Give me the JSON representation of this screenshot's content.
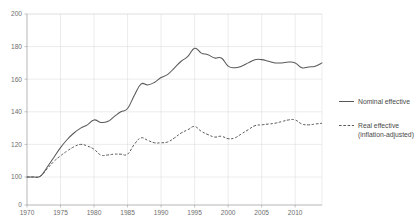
{
  "chart_data": {
    "type": "line",
    "title": "",
    "xlabel": "",
    "ylabel": "",
    "grid": true,
    "legend_position": "right",
    "xlim": [
      1970,
      2014
    ],
    "ylim": [
      0,
      200
    ],
    "y_axis_break": true,
    "y_tick_labels": [
      "200",
      "180",
      "160",
      "140",
      "120",
      "100",
      "0"
    ],
    "y_ticks": [
      200,
      180,
      160,
      140,
      120,
      100,
      0
    ],
    "x_tick_labels": [
      "1970",
      "1975",
      "1980",
      "1985",
      "1990",
      "1995",
      "2000",
      "2005",
      "2010"
    ],
    "x_ticks": [
      1970,
      1975,
      1980,
      1985,
      1990,
      1995,
      2000,
      2005,
      2010
    ],
    "x": [
      1970,
      1971,
      1972,
      1973,
      1974,
      1975,
      1976,
      1977,
      1978,
      1979,
      1980,
      1981,
      1982,
      1983,
      1984,
      1985,
      1986,
      1987,
      1988,
      1989,
      1990,
      1991,
      1992,
      1993,
      1994,
      1995,
      1996,
      1997,
      1998,
      1999,
      2000,
      2001,
      2002,
      2003,
      2004,
      2005,
      2006,
      2007,
      2008,
      2009,
      2010,
      2011,
      2012,
      2013,
      2014
    ],
    "series": [
      {
        "name": "Nominal effective",
        "style": "solid",
        "color": "#595959",
        "values": [
          100,
          100,
          100.5,
          106,
          112,
          118,
          123,
          127,
          130,
          132,
          135,
          133.5,
          134,
          137,
          140,
          142,
          150,
          157,
          156.5,
          158,
          161,
          163,
          167,
          171,
          174,
          179,
          176,
          175,
          173,
          173,
          168,
          167,
          168,
          170,
          172,
          172,
          171,
          170,
          170,
          170.5,
          170,
          167,
          167.5,
          168,
          170
        ]
      },
      {
        "name": "Real effective (inflation-adjusted)",
        "style": "dashed",
        "color": "#595959",
        "values": [
          100,
          100,
          100.5,
          105,
          109.5,
          113,
          116,
          118.5,
          120,
          119,
          117,
          113.5,
          113.5,
          114,
          114,
          114,
          120,
          124,
          122.5,
          121,
          121,
          121.5,
          124,
          127,
          129,
          131,
          128,
          126,
          124.5,
          125,
          123.5,
          124,
          126.5,
          129,
          131.5,
          132,
          132.5,
          133,
          134,
          135,
          135,
          132.5,
          132,
          132.5,
          133
        ]
      }
    ]
  },
  "legend": {
    "entries": [
      {
        "label": "Nominal effective",
        "label2": ""
      },
      {
        "label": "Real effective",
        "label2": "(inflation-adjusted)"
      }
    ]
  },
  "axis": {
    "y_labels": [
      "200",
      "180",
      "160",
      "140",
      "120",
      "100",
      "0"
    ],
    "x_labels": [
      "1970",
      "1975",
      "1980",
      "1985",
      "1990",
      "1995",
      "2000",
      "2005",
      "2010"
    ]
  },
  "colors": {
    "line": "#595959",
    "grid": "#d8d8d8",
    "axis": "#9a9a9a",
    "text": "#6e6e6e"
  }
}
